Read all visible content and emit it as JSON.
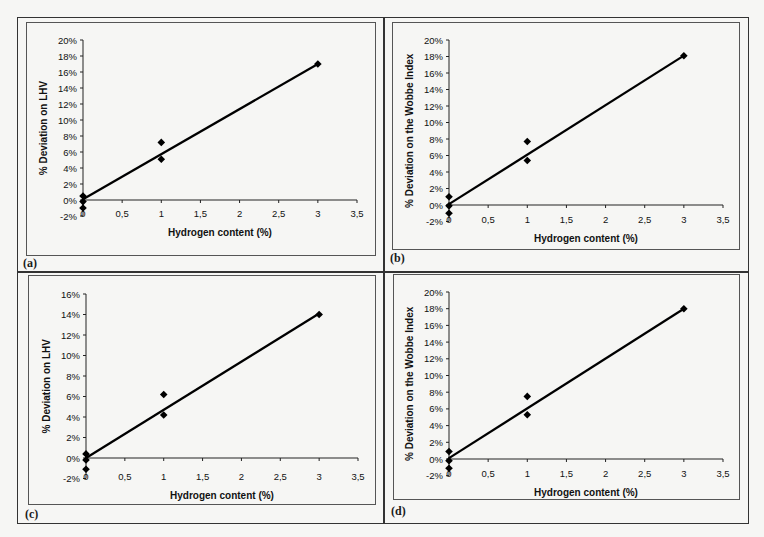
{
  "header": {
    "page_marker": ""
  },
  "panels": [
    {
      "id": "a",
      "label": "(a)",
      "ylabel": "% Deviation on LHV",
      "xlabel": "Hydrogen content (%)"
    },
    {
      "id": "b",
      "label": "(b)",
      "ylabel": "% Deviation on the Wobbe Index",
      "xlabel": "Hydrogen content (%)"
    },
    {
      "id": "c",
      "label": "(c)",
      "ylabel": "% Deviation on LHV",
      "xlabel": "Hydrogen content (%)"
    },
    {
      "id": "d",
      "label": "(d)",
      "ylabel": "% Deviation on the Wobbe Index",
      "xlabel": "Hydrogen content (%)"
    }
  ],
  "chart_data": [
    {
      "panel": "(a)",
      "type": "scatter",
      "title": "",
      "xlabel": "Hydrogen content (%)",
      "ylabel": "% Deviation on LHV",
      "xlim": [
        0,
        3.5
      ],
      "ylim": [
        -2,
        20
      ],
      "xticks": [
        "0",
        "0,5",
        "1",
        "1,5",
        "2",
        "2,5",
        "3",
        "3,5"
      ],
      "yticks": [
        "-2%",
        "0%",
        "2%",
        "4%",
        "6%",
        "8%",
        "10%",
        "12%",
        "14%",
        "16%",
        "18%",
        "20%"
      ],
      "grid": false,
      "series": [
        {
          "name": "data",
          "marker": "diamond",
          "x": [
            0,
            0,
            0,
            1,
            1,
            3
          ],
          "y": [
            0.5,
            -0.2,
            -1.0,
            7.2,
            5.1,
            17.0
          ]
        },
        {
          "name": "linear fit",
          "type": "line",
          "x": [
            0,
            3
          ],
          "y": [
            0.1,
            17.0
          ]
        }
      ]
    },
    {
      "panel": "(b)",
      "type": "scatter",
      "title": "",
      "xlabel": "Hydrogen content (%)",
      "ylabel": "% Deviation on the Wobbe Index",
      "xlim": [
        0,
        3.5
      ],
      "ylim": [
        -2,
        20
      ],
      "xticks": [
        "0",
        "0,5",
        "1",
        "1,5",
        "2",
        "2,5",
        "3",
        "3,5"
      ],
      "yticks": [
        "-2%",
        "0%",
        "2%",
        "4%",
        "6%",
        "8%",
        "10%",
        "12%",
        "14%",
        "16%",
        "18%",
        "20%"
      ],
      "grid": false,
      "series": [
        {
          "name": "data",
          "marker": "diamond",
          "x": [
            0,
            0,
            0,
            1,
            1,
            3
          ],
          "y": [
            1.0,
            -0.1,
            -1.0,
            7.7,
            5.4,
            18.1
          ]
        },
        {
          "name": "linear fit",
          "type": "line",
          "x": [
            0,
            3
          ],
          "y": [
            0.1,
            18.1
          ]
        }
      ]
    },
    {
      "panel": "(c)",
      "type": "scatter",
      "title": "",
      "xlabel": "Hydrogen content (%)",
      "ylabel": "% Deviation on LHV",
      "xlim": [
        0,
        3.5
      ],
      "ylim": [
        -2,
        16
      ],
      "xticks": [
        "0",
        "0,5",
        "1",
        "1,5",
        "2",
        "2,5",
        "3",
        "3,5"
      ],
      "yticks": [
        "-2%",
        "0%",
        "2%",
        "4%",
        "6%",
        "8%",
        "10%",
        "12%",
        "14%",
        "16%"
      ],
      "grid": false,
      "series": [
        {
          "name": "data",
          "marker": "diamond",
          "x": [
            0,
            0,
            0,
            1,
            1,
            3
          ],
          "y": [
            0.4,
            -0.2,
            -1.1,
            6.2,
            4.2,
            14.0
          ]
        },
        {
          "name": "linear fit",
          "type": "line",
          "x": [
            0,
            3
          ],
          "y": [
            0.0,
            14.1
          ]
        }
      ]
    },
    {
      "panel": "(d)",
      "type": "scatter",
      "title": "",
      "xlabel": "Hydrogen content (%)",
      "ylabel": "% Deviation on the Wobbe Index",
      "xlim": [
        0,
        3.5
      ],
      "ylim": [
        -2,
        20
      ],
      "xticks": [
        "0",
        "0,5",
        "1",
        "1,5",
        "2",
        "2,5",
        "3",
        "3,5"
      ],
      "yticks": [
        "-2%",
        "0%",
        "2%",
        "4%",
        "6%",
        "8%",
        "10%",
        "12%",
        "14%",
        "16%",
        "18%",
        "20%"
      ],
      "grid": false,
      "series": [
        {
          "name": "data",
          "marker": "diamond",
          "x": [
            0,
            0,
            0,
            1,
            1,
            3
          ],
          "y": [
            0.9,
            -0.2,
            -1.1,
            7.5,
            5.3,
            18.0
          ]
        },
        {
          "name": "linear fit",
          "type": "line",
          "x": [
            0,
            3
          ],
          "y": [
            0.1,
            18.0
          ]
        }
      ]
    }
  ]
}
